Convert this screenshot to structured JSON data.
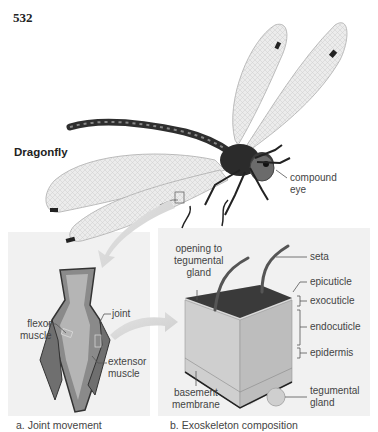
{
  "page": {
    "number": "532"
  },
  "figure": {
    "title": "Dragonfly",
    "main_labels": {
      "compound_eye": "compound\neye"
    },
    "panels": [
      {
        "id": "a",
        "caption": "a. Joint movement",
        "labels": {
          "joint": "joint",
          "flexor_muscle_line1": "flexor",
          "flexor_muscle_line2": "muscle",
          "extensor_muscle_line1": "extensor",
          "extensor_muscle_line2": "muscle"
        }
      },
      {
        "id": "b",
        "caption": "b. Exoskeleton composition",
        "labels": {
          "opening_line1": "opening to",
          "opening_line2": "tegumental",
          "opening_line3": "gland",
          "seta": "seta",
          "epicuticle": "epicuticle",
          "exocuticle": "exocuticle",
          "endocuticle": "endocuticle",
          "epidermis": "epidermis",
          "tegumental_gland_line1": "tegumental",
          "tegumental_gland_line2": "gland",
          "basement_membrane_line1": "basement",
          "basement_membrane_line2": "membrane"
        }
      }
    ],
    "compound_eye_line1": "compound",
    "compound_eye_line2": "eye"
  },
  "colors": {
    "panel_bg": "#f1f1f1",
    "line": "#555555",
    "body_dark": "#2e2e2e",
    "wing": "#e6e6e6"
  }
}
